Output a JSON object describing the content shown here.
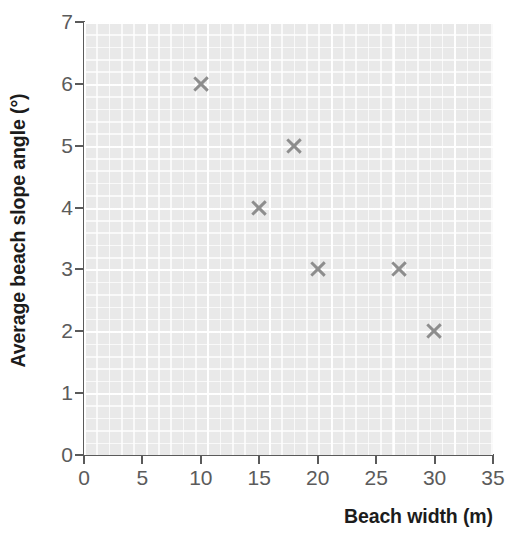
{
  "chart_data": {
    "type": "scatter",
    "title": "",
    "xlabel": "Beach width (m)",
    "ylabel": "Average beach slope angle (°)",
    "xlim": [
      0,
      35
    ],
    "ylim": [
      0,
      7
    ],
    "xticks": [
      0,
      5,
      10,
      15,
      20,
      25,
      30,
      35
    ],
    "yticks": [
      0,
      1,
      2,
      3,
      4,
      5,
      6,
      7
    ],
    "xtick_labels": [
      "0",
      "5",
      "10",
      "15",
      "20",
      "25",
      "30",
      "35"
    ],
    "ytick_labels": [
      "0",
      "1",
      "2",
      "3",
      "4",
      "5",
      "6",
      "7"
    ],
    "grid": true,
    "grid_style": "graph-paper",
    "legend": null,
    "marker": "x",
    "marker_color": "#8d8d8d",
    "plot_background": "#e9e9e9",
    "gridline_color": "#ffffff",
    "axis_color": "#5a5a5a",
    "tick_label_color": "#5b5b5b",
    "axis_title_color": "#1c1c1c",
    "points": [
      {
        "x": 10,
        "y": 6
      },
      {
        "x": 15,
        "y": 4
      },
      {
        "x": 18,
        "y": 5
      },
      {
        "x": 20,
        "y": 3
      },
      {
        "x": 27,
        "y": 3
      },
      {
        "x": 30,
        "y": 2
      }
    ]
  }
}
